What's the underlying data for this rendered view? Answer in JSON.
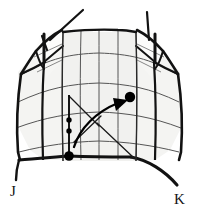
{
  "figure": {
    "background_color": "#ffffff",
    "panel_fill_color": "#f1f1ef",
    "flap_fill_color": "#fbfbfa",
    "outline_color": "#121212",
    "grid_line_color": "#555555",
    "marker_color": "#000000",
    "arrow_color": "#000000",
    "labels": [
      {
        "id": "label-j",
        "text": "J",
        "x": 10,
        "y": 196
      },
      {
        "id": "label-k",
        "text": "K",
        "x": 175,
        "y": 203
      }
    ],
    "markers": {
      "small_dots": [
        {
          "id": "dot-upper",
          "cx": 70,
          "cy": 120,
          "r": 2.6
        },
        {
          "id": "dot-lower",
          "cx": 70,
          "cy": 131,
          "r": 2.6
        }
      ],
      "large_dots": [
        {
          "id": "dot-origin",
          "cx": 69,
          "cy": 156,
          "r": 4.6
        },
        {
          "id": "dot-target",
          "cx": 130,
          "cy": 97,
          "r": 5.0
        }
      ]
    },
    "arrow": {
      "id": "motion-arrow",
      "path": "M 74 147 C 80 128, 96 112, 119 103",
      "head_points": "113,99 127,100 116,110"
    },
    "annotation_lines": [
      {
        "id": "leader-upper-left",
        "d": "M 69 95 L 98 125"
      },
      {
        "id": "leader-lower-right",
        "d": "M 96 122 L 133 157"
      },
      {
        "id": "leader-cross",
        "d": "M 100 117 L 75 140"
      }
    ],
    "grid": {
      "columns": 4,
      "rows": 4,
      "style": "curved"
    }
  }
}
